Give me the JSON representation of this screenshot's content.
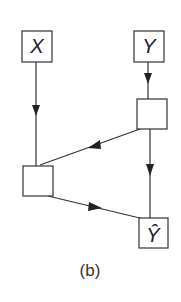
{
  "diagram": {
    "caption": "(b)",
    "nodes": [
      {
        "id": "x",
        "label": "X"
      },
      {
        "id": "y",
        "label": "Y"
      },
      {
        "id": "hidden-right",
        "label": ""
      },
      {
        "id": "hidden-left",
        "label": ""
      },
      {
        "id": "y-hat",
        "label": "Ŷ"
      }
    ],
    "edges": [
      {
        "from": "x",
        "to": "hidden-left"
      },
      {
        "from": "y",
        "to": "hidden-right"
      },
      {
        "from": "hidden-right",
        "to": "hidden-left"
      },
      {
        "from": "hidden-right",
        "to": "y-hat"
      },
      {
        "from": "hidden-left",
        "to": "y-hat"
      }
    ],
    "colors": {
      "stroke": "#333333",
      "background": "#ffffff"
    }
  }
}
